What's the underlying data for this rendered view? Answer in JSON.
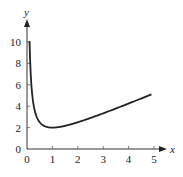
{
  "chart_data": {
    "type": "line",
    "title": "",
    "xlabel": "x",
    "ylabel": "y",
    "xlim": [
      0,
      5
    ],
    "ylim": [
      0,
      10
    ],
    "grid": false,
    "legend": null,
    "x_ticks": [
      "0",
      "1",
      "2",
      "3",
      "4",
      "5"
    ],
    "y_ticks": [
      "0",
      "2",
      "4",
      "6",
      "8",
      "10"
    ],
    "function_hint": "y = x + 1/x",
    "series": [
      {
        "name": "curve",
        "color": "#222222",
        "x": [
          0.1,
          0.15,
          0.2,
          0.3,
          0.4,
          0.5,
          0.6,
          0.7,
          0.8,
          0.9,
          1.0,
          1.25,
          1.5,
          2.0,
          2.5,
          3.0,
          3.5,
          4.0,
          4.5,
          4.9
        ],
        "y": [
          10.1,
          6.82,
          5.2,
          3.63,
          2.9,
          2.5,
          2.27,
          2.13,
          2.05,
          2.01,
          2.0,
          2.05,
          2.17,
          2.5,
          2.9,
          3.33,
          3.79,
          4.25,
          4.72,
          5.1
        ]
      }
    ]
  }
}
